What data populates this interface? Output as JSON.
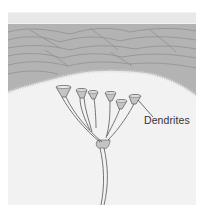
{
  "figure": {
    "labels": {
      "dendrites": "Dendrites"
    },
    "colors": {
      "background_panel": "#f2f2f2",
      "upper_layer": "#b0b0b0",
      "layer_lines": "#8a8a8a",
      "nerve_fill": "#c4c4c4",
      "nerve_stroke": "#555555"
    }
  }
}
